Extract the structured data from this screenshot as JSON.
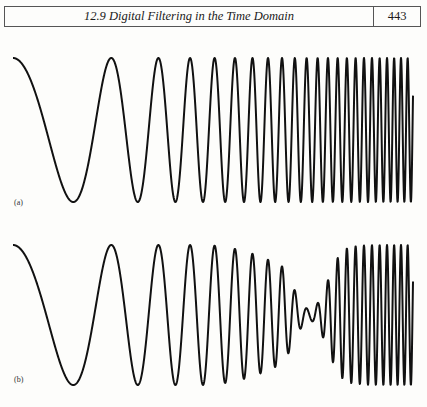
{
  "header": {
    "section_title": "12.9 Digital Filtering in the Time Domain",
    "page_number": "443"
  },
  "colors": {
    "ink": "#111111",
    "rule": "#555555",
    "paper": "#fdfdfb"
  },
  "chart_data": [
    {
      "type": "line",
      "label": "(a)",
      "title": "",
      "description": "Chirp signal: constant amplitude, frequency increasing from low (left) to high (right)",
      "x_range": [
        13,
        413
      ],
      "center_y": 130,
      "amplitude": 72,
      "phase_params": {
        "a": 0.045,
        "c": 1.96e-06
      },
      "filter": null,
      "xlabel": "",
      "ylabel": "",
      "grid": false
    },
    {
      "type": "line",
      "label": "(b)",
      "title": "",
      "description": "Same chirp after digital filtering: amplitude suppressed in a band of frequencies (notch) around the middle, full amplitude elsewhere",
      "x_range": [
        13,
        413
      ],
      "center_y": 315,
      "amplitude": 70,
      "phase_params": {
        "a": 0.045,
        "c": 1.96e-06
      },
      "filter": {
        "notch_center_x": 310,
        "notch_width": 38,
        "min_gain": 0.08,
        "overshoot_x": 338,
        "overshoot_gain": 1.1
      },
      "xlabel": "",
      "ylabel": "",
      "grid": false
    }
  ]
}
